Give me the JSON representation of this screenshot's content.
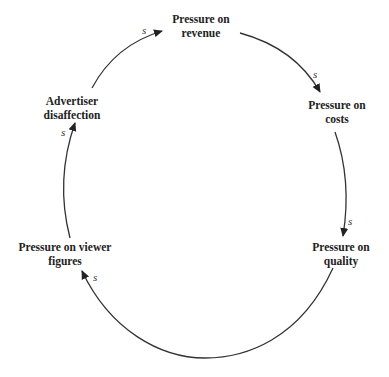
{
  "diagram": {
    "type": "causal-loop",
    "nodes": [
      {
        "id": "revenue",
        "line1": "Pressure on",
        "line2": "revenue"
      },
      {
        "id": "costs",
        "line1": "Pressure on",
        "line2": "costs"
      },
      {
        "id": "quality",
        "line1": "Pressure on",
        "line2": "quality"
      },
      {
        "id": "viewer",
        "line1": "Pressure on viewer",
        "line2": "figures"
      },
      {
        "id": "advertiser",
        "line1": "Advertiser",
        "line2": "disaffection"
      }
    ],
    "links": [
      {
        "from": "advertiser",
        "to": "revenue",
        "polarity": "s"
      },
      {
        "from": "revenue",
        "to": "costs",
        "polarity": "s"
      },
      {
        "from": "costs",
        "to": "quality",
        "polarity": "s"
      },
      {
        "from": "quality",
        "to": "viewer",
        "polarity": "s"
      },
      {
        "from": "viewer",
        "to": "advertiser",
        "polarity": "s"
      }
    ],
    "colors": {
      "line": "#333333",
      "text": "#222222",
      "background": "#ffffff"
    }
  }
}
